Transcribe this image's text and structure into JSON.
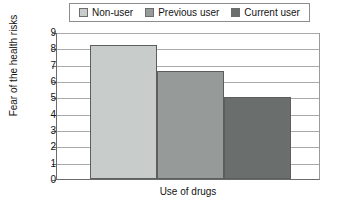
{
  "chart_data": {
    "type": "bar",
    "title": "",
    "categories": [
      "Non-user",
      "Previous user",
      "Current user"
    ],
    "values": [
      8.2,
      6.6,
      5.0
    ],
    "series": [
      {
        "name": "Fear of the health risks",
        "values": [
          8.2,
          6.6,
          5.0
        ]
      }
    ],
    "xlabel": "Use of drugs",
    "ylabel": "Fear of the health risks",
    "ylim": [
      0,
      9
    ],
    "ytick_labels": [
      "9",
      "8",
      "7",
      "6",
      "5",
      "4",
      "3",
      "2",
      "1",
      "0"
    ],
    "ytick_values": [
      9,
      8,
      7,
      6,
      5,
      4,
      3,
      2,
      1,
      0
    ],
    "xtick_labels": [],
    "grid": "horizontal",
    "legend_position": "top-center",
    "colors": {
      "non_user": "#c8cccb",
      "previous_user": "#969a99",
      "current_user": "#6a6e6d",
      "bar_border": "#5d5d5d",
      "gridline": "#a9a9a9",
      "axis": "#6b6b6b",
      "legend_border": "#8d8d8d",
      "background": "#ffffff",
      "text": "#141414"
    }
  },
  "legend": {
    "items": [
      {
        "label": "Non-user",
        "color": "#c8cccb",
        "swatch_name": "legend-swatch-non-user"
      },
      {
        "label": "Previous user",
        "color": "#969a99",
        "swatch_name": "legend-swatch-previous-user"
      },
      {
        "label": "Current user",
        "color": "#6a6e6d",
        "swatch_name": "legend-swatch-current-user"
      }
    ]
  }
}
